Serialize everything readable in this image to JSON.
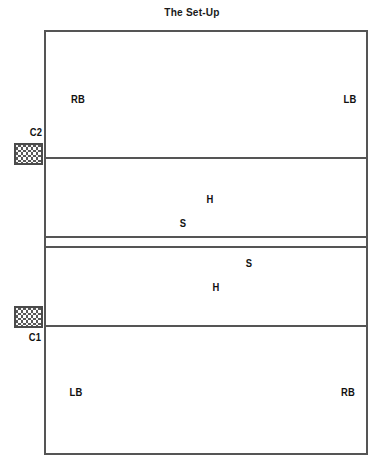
{
  "title": "The Set-Up",
  "court": {
    "name": "volleyball-court",
    "lines": [
      {
        "id": "attack-line-top",
        "y": 157
      },
      {
        "id": "center-line-upper",
        "y": 236
      },
      {
        "id": "center-line-lower",
        "y": 246
      },
      {
        "id": "attack-line-bottom",
        "y": 325
      }
    ]
  },
  "players": [
    {
      "id": "player-rb-top",
      "label": "RB",
      "x": 78,
      "y": 99,
      "zone": "top-back-row"
    },
    {
      "id": "player-lb-top",
      "label": "LB",
      "x": 350,
      "y": 99,
      "zone": "top-back-row"
    },
    {
      "id": "player-h-upper-middle",
      "label": "H",
      "x": 210,
      "y": 199,
      "zone": "upper-front-row"
    },
    {
      "id": "player-s-upper-middle",
      "label": "S",
      "x": 183,
      "y": 223,
      "zone": "upper-front-row"
    },
    {
      "id": "player-s-lower-middle",
      "label": "S",
      "x": 249,
      "y": 263,
      "zone": "lower-front-row"
    },
    {
      "id": "player-h-lower-middle",
      "label": "H",
      "x": 216,
      "y": 287,
      "zone": "lower-front-row"
    },
    {
      "id": "player-lb-bottom",
      "label": "LB",
      "x": 76,
      "y": 392,
      "zone": "bottom-back-row"
    },
    {
      "id": "player-rb-bottom",
      "label": "RB",
      "x": 348,
      "y": 392,
      "zone": "bottom-back-row"
    }
  ],
  "carts": [
    {
      "id": "cart-c2",
      "label": "C2",
      "x": 14,
      "y": 143,
      "label_x": 36,
      "label_y": 132,
      "label_position": "above"
    },
    {
      "id": "cart-c1",
      "label": "C1",
      "x": 14,
      "y": 306,
      "label_x": 35,
      "label_y": 337,
      "label_position": "below"
    }
  ],
  "colors": {
    "line": "#555555",
    "text": "#111111",
    "background": "#ffffff",
    "cart_border": "#4a4a4a",
    "cart_fill": "#f2f2f2"
  }
}
